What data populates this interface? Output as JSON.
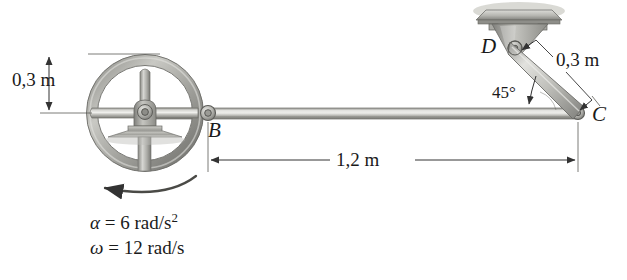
{
  "figure": {
    "background_color": "#ffffff",
    "ink_color": "#4a4a4a",
    "line_color": "#2b2b2b"
  },
  "labels": {
    "wheel_radius_dim": "0,3 m",
    "link_length_dim": "0,3 m",
    "rod_length_dim": "1,2 m",
    "angle": "45°",
    "point_b": "B",
    "point_c": "C",
    "point_d": "D",
    "alpha_symbol": "α",
    "alpha_equals": " = 6 rad/s",
    "alpha_exponent": "2",
    "omega_symbol": "ω",
    "omega_equals": " = 12 rad/s"
  },
  "geometry": {
    "wheel_center_x": 145,
    "wheel_center_y": 113,
    "wheel_outer_radius": 58,
    "wheel_inner_radius": 48,
    "point_b_x": 208,
    "point_b_y": 113,
    "point_c_x": 578,
    "point_c_y": 113,
    "point_d_x": 513,
    "point_d_y": 48,
    "rod_thickness": 10,
    "dimension_line_y": 160,
    "vertical_dim_x": 49
  },
  "parts": [
    {
      "name": "flywheel",
      "type": "spoked-wheel"
    },
    {
      "name": "hub-bearing",
      "type": "pivot"
    },
    {
      "name": "pedestal-base",
      "type": "support"
    },
    {
      "name": "rod-bc",
      "type": "link"
    },
    {
      "name": "link-dc",
      "type": "link"
    },
    {
      "name": "ceiling-bracket-d",
      "type": "fixed-support"
    }
  ]
}
